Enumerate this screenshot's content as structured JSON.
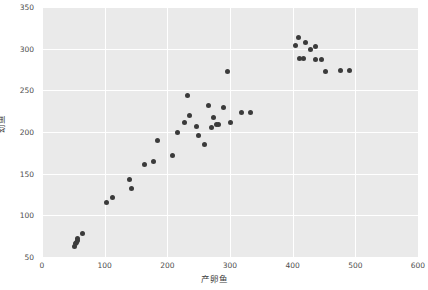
{
  "chart_data": {
    "type": "scatter",
    "title": "",
    "xlabel": "产卵鱼",
    "ylabel": "幼鱼",
    "xlim": [
      0,
      600
    ],
    "ylim": [
      50,
      350
    ],
    "xticks": [
      0,
      100,
      200,
      300,
      400,
      500,
      600
    ],
    "yticks": [
      50,
      100,
      150,
      200,
      250,
      300,
      350
    ],
    "grid": true,
    "legend": null,
    "marker_color": "#3b3b3b",
    "plot_background": "#eaeaea",
    "grid_color": "#ffffff",
    "points": [
      [
        52,
        63
      ],
      [
        53,
        66
      ],
      [
        55,
        68
      ],
      [
        56,
        70
      ],
      [
        57,
        72
      ],
      [
        64,
        78
      ],
      [
        103,
        116
      ],
      [
        113,
        121
      ],
      [
        140,
        143
      ],
      [
        143,
        132
      ],
      [
        163,
        161
      ],
      [
        178,
        165
      ],
      [
        185,
        190
      ],
      [
        208,
        172
      ],
      [
        216,
        199
      ],
      [
        228,
        211
      ],
      [
        232,
        244
      ],
      [
        236,
        220
      ],
      [
        247,
        207
      ],
      [
        249,
        196
      ],
      [
        259,
        185
      ],
      [
        266,
        232
      ],
      [
        270,
        205
      ],
      [
        274,
        218
      ],
      [
        279,
        209
      ],
      [
        282,
        209
      ],
      [
        290,
        229
      ],
      [
        296,
        273
      ],
      [
        300,
        211
      ],
      [
        319,
        224
      ],
      [
        332,
        224
      ],
      [
        404,
        304
      ],
      [
        409,
        313
      ],
      [
        411,
        288
      ],
      [
        417,
        288
      ],
      [
        421,
        307
      ],
      [
        428,
        299
      ],
      [
        436,
        303
      ],
      [
        437,
        287
      ],
      [
        446,
        287
      ],
      [
        452,
        273
      ],
      [
        477,
        274
      ],
      [
        491,
        274
      ]
    ]
  }
}
